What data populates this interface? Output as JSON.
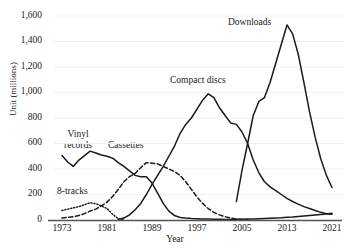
{
  "chart_data": {
    "type": "line",
    "title": "",
    "xlabel": "Year",
    "ylabel": "Unit (millions)",
    "xlim": [
      1973,
      2021
    ],
    "ylim": [
      0,
      1600
    ],
    "xticks": [
      "1973",
      "1981",
      "1989",
      "1997",
      "2005",
      "2013",
      "2021"
    ],
    "yticks": [
      "0",
      "200",
      "400",
      "600",
      "800",
      "1,000",
      "1,200",
      "1,400",
      "1,600"
    ],
    "grid": true,
    "legend_position": "inline-annotations",
    "series": [
      {
        "name": "Vinyl records",
        "style": "solid",
        "color": "#1a1a1a",
        "x": [
          1973,
          1974,
          1975,
          1976,
          1977,
          1978,
          1979,
          1980,
          1981,
          1982,
          1983,
          1984,
          1985,
          1986,
          1987,
          1988,
          1989,
          1990,
          1991,
          1992,
          1993,
          1994,
          1995,
          1996,
          1997,
          1998,
          1999,
          2000,
          2001,
          2002,
          2003,
          2004,
          2005,
          2006,
          2007,
          2008,
          2009,
          2010,
          2011,
          2012,
          2013,
          2014,
          2015,
          2016,
          2017,
          2018,
          2019,
          2020,
          2021
        ],
        "values": [
          505,
          455,
          420,
          470,
          505,
          540,
          525,
          510,
          500,
          485,
          450,
          420,
          385,
          350,
          340,
          340,
          290,
          210,
          130,
          70,
          35,
          20,
          15,
          12,
          10,
          8,
          7,
          6,
          5,
          4,
          4,
          5,
          6,
          7,
          8,
          10,
          12,
          14,
          16,
          18,
          21,
          24,
          28,
          32,
          36,
          40,
          44,
          48,
          52
        ]
      },
      {
        "name": "8-tracks",
        "style": "dotted",
        "color": "#1a1a1a",
        "x": [
          1973,
          1974,
          1975,
          1976,
          1977,
          1978,
          1979,
          1980,
          1981,
          1982,
          1983,
          1984
        ],
        "values": [
          75,
          85,
          95,
          105,
          120,
          135,
          128,
          110,
          90,
          45,
          10,
          0
        ]
      },
      {
        "name": "Cassettes",
        "style": "dashed",
        "color": "#1a1a1a",
        "x": [
          1973,
          1974,
          1975,
          1976,
          1977,
          1978,
          1979,
          1980,
          1981,
          1982,
          1983,
          1984,
          1985,
          1986,
          1987,
          1988,
          1989,
          1990,
          1991,
          1992,
          1993,
          1994,
          1995,
          1996,
          1997,
          1998,
          1999,
          2000,
          2001,
          2002,
          2003,
          2004,
          2005,
          2006
        ],
        "values": [
          15,
          20,
          25,
          35,
          50,
          70,
          85,
          110,
          140,
          185,
          240,
          300,
          340,
          365,
          410,
          450,
          445,
          440,
          420,
          400,
          380,
          350,
          300,
          240,
          180,
          130,
          90,
          60,
          40,
          25,
          15,
          8,
          4,
          2
        ]
      },
      {
        "name": "Compact discs",
        "style": "solid",
        "color": "#1a1a1a",
        "x": [
          1983,
          1984,
          1985,
          1986,
          1987,
          1988,
          1989,
          1990,
          1991,
          1992,
          1993,
          1994,
          1995,
          1996,
          1997,
          1998,
          1999,
          2000,
          2001,
          2002,
          2003,
          2004,
          2005,
          2006,
          2007,
          2008,
          2009,
          2010,
          2011,
          2012,
          2013,
          2014,
          2015,
          2016,
          2017,
          2018,
          2019,
          2020,
          2021
        ],
        "values": [
          5,
          15,
          40,
          80,
          130,
          200,
          280,
          350,
          420,
          500,
          580,
          680,
          750,
          800,
          870,
          940,
          990,
          960,
          880,
          820,
          760,
          750,
          690,
          600,
          470,
          370,
          300,
          260,
          230,
          200,
          170,
          145,
          125,
          105,
          90,
          75,
          60,
          50,
          45
        ]
      },
      {
        "name": "Downloads",
        "style": "solid",
        "color": "#1a1a1a",
        "x": [
          2004,
          2005,
          2006,
          2007,
          2008,
          2009,
          2010,
          2011,
          2012,
          2013,
          2014,
          2015,
          2016,
          2017,
          2018,
          2019,
          2020,
          2021
        ],
        "values": [
          145,
          390,
          600,
          820,
          930,
          960,
          1080,
          1230,
          1380,
          1530,
          1460,
          1300,
          1080,
          850,
          650,
          480,
          350,
          255
        ]
      }
    ],
    "annotations": [
      {
        "text": "Vinyl records",
        "series": "Vinyl records"
      },
      {
        "text": "8-tracks",
        "series": "8-tracks"
      },
      {
        "text": "Cassettes",
        "series": "Cassettes"
      },
      {
        "text": "Compact discs",
        "series": "Compact discs"
      },
      {
        "text": "Downloads",
        "series": "Downloads"
      }
    ]
  }
}
